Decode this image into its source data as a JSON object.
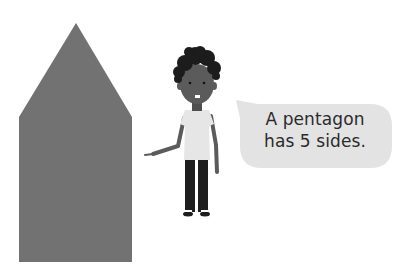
{
  "illustration": {
    "shape": {
      "name": "pentagon",
      "sides": 5,
      "fill": "#727272"
    },
    "character": {
      "description": "boy pointing at pentagon",
      "skin": "#5b5b5b",
      "hair": "#1c1c1c",
      "shirt": "#e6e6e6",
      "trousers": "#1e1e1e"
    },
    "speech_bubble": {
      "fill": "#e3e3e3",
      "line1": "A pentagon",
      "line2": "has 5 sides."
    }
  }
}
